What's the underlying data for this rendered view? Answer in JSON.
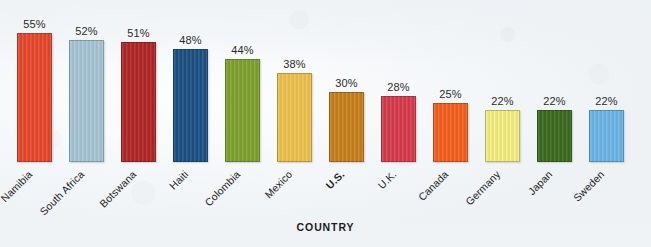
{
  "chart_data": {
    "type": "bar",
    "title": "",
    "xlabel": "COUNTRY",
    "ylabel": "",
    "ylim": [
      0,
      60
    ],
    "grid": false,
    "legend": "none",
    "value_suffix": "%",
    "categories": [
      "Namibia",
      "South Africa",
      "Botswana",
      "Haiti",
      "Colombia",
      "Mexico",
      "U.S.",
      "U.K.",
      "Canada",
      "Germany",
      "Japan",
      "Sweden"
    ],
    "values": [
      55,
      52,
      51,
      48,
      44,
      38,
      30,
      28,
      25,
      22,
      22,
      22
    ],
    "value_labels": [
      "55%",
      "52%",
      "51%",
      "48%",
      "44%",
      "38%",
      "30%",
      "28%",
      "25%",
      "22%",
      "22%",
      "22%"
    ],
    "colors": [
      "#E8482B",
      "#A8C6D5",
      "#B22626",
      "#1B5185",
      "#7FA22F",
      "#EDC24E",
      "#C8801C",
      "#D93C4D",
      "#F4601D",
      "#F5EF82",
      "#3B6B1F",
      "#6CB6E8"
    ],
    "emphasized_category": "U.S."
  },
  "axis": {
    "title": "COUNTRY"
  }
}
